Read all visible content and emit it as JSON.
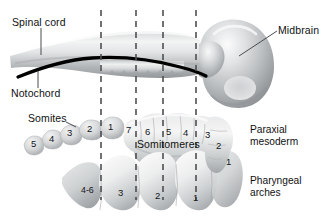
{
  "figure": {
    "width": 330,
    "height": 218,
    "background": "#ffffff",
    "ink_color": "#111111",
    "notochord_color": "#000000",
    "tissue_color": "#b9bcbe",
    "dash_color": "#4d4f52"
  },
  "labels": {
    "spinal_cord": "Spinal cord",
    "notochord": "Notochord",
    "midbrain": "Midbrain",
    "somites": "Somites",
    "somitomeres": "Somitomeres",
    "paraxial_mesoderm_line1": "Paraxial",
    "paraxial_mesoderm_line2": "mesoderm",
    "pharyngeal_arches_line1": "Pharyngeal",
    "pharyngeal_arches_line2": "arches"
  },
  "somites": {
    "name": "Somites",
    "numbers": [
      "5",
      "4",
      "3",
      "2",
      "1"
    ]
  },
  "somitomeres": {
    "name": "Somitomeres",
    "numbers": [
      "7",
      "6",
      "5",
      "4",
      "3",
      "2",
      "1"
    ]
  },
  "pharyngeal_arches": {
    "name": "Pharyngeal arches",
    "numbers": [
      "4-6",
      "3",
      "2",
      "1"
    ]
  },
  "section_lines": {
    "count": 4,
    "x_positions": [
      101,
      136,
      163,
      196
    ]
  }
}
